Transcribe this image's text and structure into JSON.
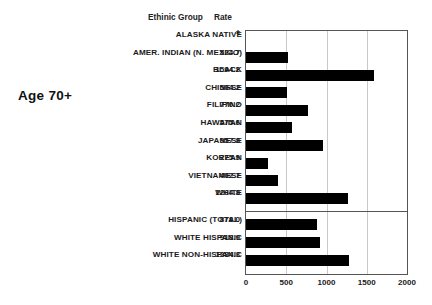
{
  "title": "Age 70+",
  "headers": {
    "group": "Ethinic Group",
    "rate": "Rate"
  },
  "chart_data": {
    "type": "bar",
    "orientation": "horizontal",
    "title": "Age 70+",
    "xlabel": "",
    "ylabel": "",
    "xlim": [
      0,
      2000
    ],
    "xticks": [
      "0",
      "500",
      "1000",
      "1500",
      "2000"
    ],
    "xtick_values": [
      0,
      500,
      1000,
      1500,
      2000
    ],
    "gridlines": [
      500,
      1000,
      1500
    ],
    "grid": true,
    "legend": "none",
    "column_headers": [
      "Ethinic Group",
      "Rate"
    ],
    "footnote_symbol": "*",
    "categories": [
      "ALASKA NATIVE",
      "AMER. INDIAN (N. MEXICO)",
      "BLACK",
      "CHINESE",
      "FILIPINO",
      "HAWAIIAN",
      "JAPANESE",
      "KOREAN",
      "VIETNAMESE",
      "WHITE",
      "HISPANIC (TOTAL)",
      "WHITE HISPANIC",
      "WHITE NON-HISPANIC"
    ],
    "values": [
      null,
      524.7,
      1594.2,
      504.2,
      770.2,
      575.6,
      957.8,
      275.9,
      402.7,
      1264.8,
      878.0,
      918.9,
      1284.3
    ],
    "value_labels": [
      "*",
      "524.7",
      "1594.2",
      "504.2",
      "770.2",
      "575.6",
      "957.8",
      "275.9",
      "402.7",
      "1264.8",
      "878.0",
      "918.9",
      "1284.3"
    ],
    "groups": [
      {
        "name": "ethnic",
        "rows": [
          {
            "label": "ALASKA NATIVE",
            "rate": "*",
            "value": null
          },
          {
            "label": "AMER. INDIAN (N. MEXICO)",
            "rate": "524.7",
            "value": 524.7
          },
          {
            "label": "BLACK",
            "rate": "1594.2",
            "value": 1594.2
          },
          {
            "label": "CHINESE",
            "rate": "504.2",
            "value": 504.2
          },
          {
            "label": "FILIPINO",
            "rate": "770.2",
            "value": 770.2
          },
          {
            "label": "HAWAIIAN",
            "rate": "575.6",
            "value": 575.6
          },
          {
            "label": "JAPANESE",
            "rate": "957.8",
            "value": 957.8
          },
          {
            "label": "KOREAN",
            "rate": "275.9",
            "value": 275.9
          },
          {
            "label": "VIETNAMESE",
            "rate": "402.7",
            "value": 402.7
          },
          {
            "label": "WHITE",
            "rate": "1264.8",
            "value": 1264.8
          }
        ]
      },
      {
        "name": "hispanic",
        "rows": [
          {
            "label": "HISPANIC (TOTAL)",
            "rate": "878.0",
            "value": 878.0
          },
          {
            "label": "WHITE HISPANIC",
            "rate": "918.9",
            "value": 918.9
          },
          {
            "label": "WHITE NON-HISPANIC",
            "rate": "1284.3",
            "value": 1284.3
          }
        ]
      }
    ],
    "colors": {
      "bar": "#000000",
      "grid": "#c9c9c9",
      "axis": "#555555",
      "background": "#ffffff"
    }
  }
}
